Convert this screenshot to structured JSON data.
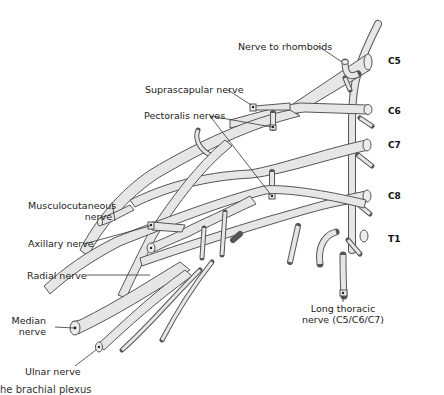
{
  "diagram": {
    "subject": "Brachial plexus",
    "roots": [
      "C5",
      "C6",
      "C7",
      "C8",
      "T1"
    ],
    "labels": {
      "nerve_to_rhomboids": "Nerve to rhomboids",
      "suprascapular": "Suprascapular nerve",
      "pectoralis": "Pectoralis nerves",
      "musculocutaneous_1": "Musculocutaneous",
      "musculocutaneous_2": "nerve",
      "axillary": "Axillary nerve",
      "radial": "Radial nerve",
      "median_1": "Median",
      "median_2": "nerve",
      "ulnar": "Ulnar nerve",
      "long_thoracic_1": "Long thoracic",
      "long_thoracic_2": "nerve (C5/C6/C7)"
    },
    "caption": "he brachial plexus"
  },
  "colors": {
    "nerve_fill": "#e6e6e6",
    "outline": "#555555",
    "text": "#222222"
  }
}
